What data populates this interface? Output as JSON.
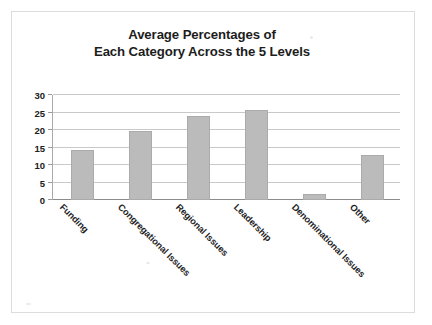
{
  "chart_data": {
    "type": "bar",
    "title": "Average Percentages of Each Category Across the 5 Levels",
    "title_lines": [
      "Average Percentages of",
      "Each Category Across the 5 Levels"
    ],
    "categories": [
      "Funding",
      "Congregational Issues",
      "Regional Issues",
      "Leadership",
      "Denominational Issues",
      "Other"
    ],
    "values": [
      14.2,
      19.7,
      24.0,
      25.8,
      1.6,
      13.0
    ],
    "xlabel": "",
    "ylabel": "",
    "ylim": [
      0,
      30
    ],
    "ytick_labels": [
      "0",
      "5",
      "10",
      "15",
      "20",
      "25",
      "30"
    ],
    "ytick_values": [
      0,
      5,
      10,
      15,
      20,
      25,
      30
    ],
    "grid": true,
    "legend": false,
    "legend_position": "none",
    "series": [
      {
        "name": "Average Percentage",
        "values": [
          14.2,
          19.7,
          24.0,
          25.8,
          1.6,
          13.0
        ]
      }
    ]
  },
  "style": {
    "bar_color": "#bbbbbb",
    "bar_border_color": "#ababab",
    "gridline_color": "#c9c9c9",
    "axis_color": "#8c8c8c",
    "text_color": "#1d1d1d",
    "page_background": "#ffffff",
    "frame_border_color": "#dcdcdc"
  }
}
